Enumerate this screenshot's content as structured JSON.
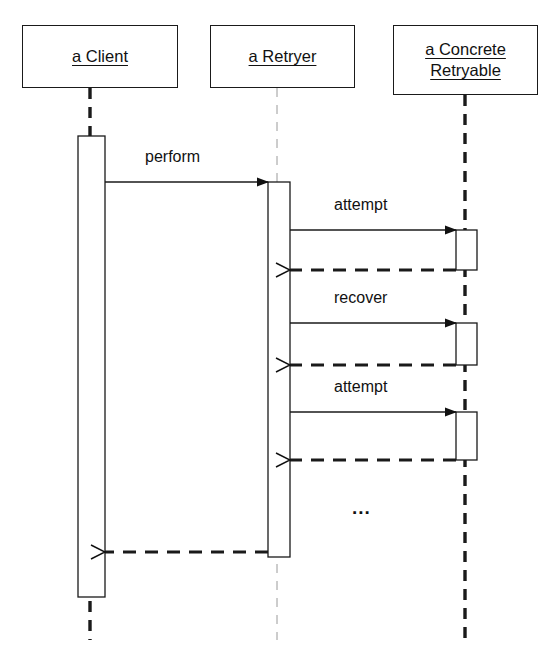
{
  "diagram": {
    "kind": "uml-sequence-diagram",
    "canvas": {
      "width": 558,
      "height": 657
    },
    "colors": {
      "stroke": "#1a1a1a",
      "thin_stroke": "#9a9a9a",
      "background": "#ffffff",
      "text": "#111111"
    },
    "participants": [
      {
        "id": "client",
        "label": "a Client",
        "label_lines": [
          "a Client"
        ],
        "box": {
          "x": 22,
          "y": 25,
          "w": 156,
          "h": 63
        },
        "lifeline_x": 90,
        "lifeline_style": "thick-dashed"
      },
      {
        "id": "retryer",
        "label": "a Retryer",
        "label_lines": [
          "a Retryer"
        ],
        "box": {
          "x": 210,
          "y": 25,
          "w": 145,
          "h": 63
        },
        "lifeline_x": 277,
        "lifeline_style": "thin-dashed"
      },
      {
        "id": "retryable",
        "label": "a Concrete Retryable",
        "label_lines": [
          "a Concrete",
          "Retryable"
        ],
        "box": {
          "x": 393,
          "y": 25,
          "w": 145,
          "h": 70
        },
        "lifeline_x": 465,
        "lifeline_style": "thick-dashed"
      }
    ],
    "activations": [
      {
        "owner": "client",
        "x": 78,
        "y": 136,
        "w": 27,
        "h": 461
      },
      {
        "owner": "retryer",
        "x": 268,
        "y": 182,
        "w": 22,
        "h": 375
      },
      {
        "owner": "retryable",
        "x": 456,
        "y": 230,
        "w": 21,
        "h": 40
      },
      {
        "owner": "retryable",
        "x": 456,
        "y": 323,
        "w": 21,
        "h": 42
      },
      {
        "owner": "retryable",
        "x": 456,
        "y": 412,
        "w": 21,
        "h": 48
      }
    ],
    "messages": [
      {
        "id": "m1",
        "label": "perform",
        "from": "client",
        "to": "retryer",
        "x1": 105,
        "x2": 268,
        "y": 182,
        "type": "call",
        "arrow": "filled",
        "label_x": 145,
        "label_y": 148
      },
      {
        "id": "m2",
        "label": "attempt",
        "from": "retryer",
        "to": "retryable",
        "x1": 290,
        "x2": 456,
        "y": 230,
        "type": "call",
        "arrow": "filled",
        "label_x": 334,
        "label_y": 196
      },
      {
        "id": "r2",
        "label": "",
        "from": "retryable",
        "to": "retryer",
        "x1": 456,
        "x2": 290,
        "y": 270,
        "type": "return",
        "arrow": "open",
        "label_x": 0,
        "label_y": 0
      },
      {
        "id": "m3",
        "label": "recover",
        "from": "retryer",
        "to": "retryable",
        "x1": 290,
        "x2": 456,
        "y": 323,
        "type": "call",
        "arrow": "filled",
        "label_x": 334,
        "label_y": 289
      },
      {
        "id": "r3",
        "label": "",
        "from": "retryable",
        "to": "retryer",
        "x1": 456,
        "x2": 290,
        "y": 365,
        "type": "return",
        "arrow": "open",
        "label_x": 0,
        "label_y": 0
      },
      {
        "id": "m4",
        "label": "attempt",
        "from": "retryer",
        "to": "retryable",
        "x1": 290,
        "x2": 456,
        "y": 412,
        "type": "call",
        "arrow": "filled",
        "label_x": 334,
        "label_y": 378
      },
      {
        "id": "r4",
        "label": "",
        "from": "retryable",
        "to": "retryer",
        "x1": 456,
        "x2": 290,
        "y": 460,
        "type": "return",
        "arrow": "open",
        "label_x": 0,
        "label_y": 0
      },
      {
        "id": "r1",
        "label": "",
        "from": "retryer",
        "to": "client",
        "x1": 268,
        "x2": 105,
        "y": 552,
        "type": "return",
        "arrow": "open",
        "label_x": 0,
        "label_y": 0
      }
    ],
    "annotations": [
      {
        "id": "continuation",
        "text": "...",
        "x": 352,
        "y": 498
      }
    ]
  }
}
